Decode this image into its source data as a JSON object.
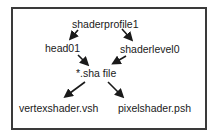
{
  "diagram": {
    "nodes": {
      "root": "shaderprofile1",
      "left": "head01",
      "right": "shaderlevel0",
      "middle": "*.sha file",
      "bottom_left": "vertexshader.vsh",
      "bottom_right": "pixelshader.psh"
    },
    "edges": [
      [
        "shaderprofile1",
        "head01"
      ],
      [
        "shaderprofile1",
        "shaderlevel0"
      ],
      [
        "head01",
        "*.sha file"
      ],
      [
        "shaderlevel0",
        "*.sha file"
      ],
      [
        "*.sha file",
        "vertexshader.vsh"
      ],
      [
        "*.sha file",
        "pixelshader.psh"
      ]
    ],
    "colors": {
      "stroke": "#1a1a1a",
      "border": "#3a3a3a",
      "background": "#ffffff"
    }
  }
}
